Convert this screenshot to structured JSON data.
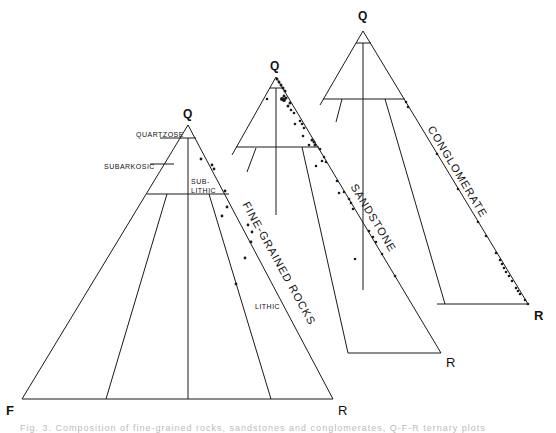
{
  "figure": {
    "caption": "Fig. 3. Composition of fine-grained rocks, sandstones and conglomerates, Q-F-R ternary plots"
  },
  "fine_grained": {
    "apex_label": "Q",
    "left_label": "F",
    "right_label": "R",
    "title": "FINE-GRAINED ROCKS",
    "fields": {
      "quartzose": "QUARTZOSE",
      "subarkosic": "SUBARKOSIC",
      "sublithic_1": "SUB-",
      "sublithic_2": "LITHIC",
      "lithic": "LITHIC"
    }
  },
  "sandstone": {
    "apex_label": "Q",
    "right_label": "R",
    "title": "SANDSTONE"
  },
  "conglomerate": {
    "apex_label": "Q",
    "right_label": "R",
    "title": "CONGLOMERATE"
  },
  "colors": {
    "ink": "#1a1a1a"
  }
}
